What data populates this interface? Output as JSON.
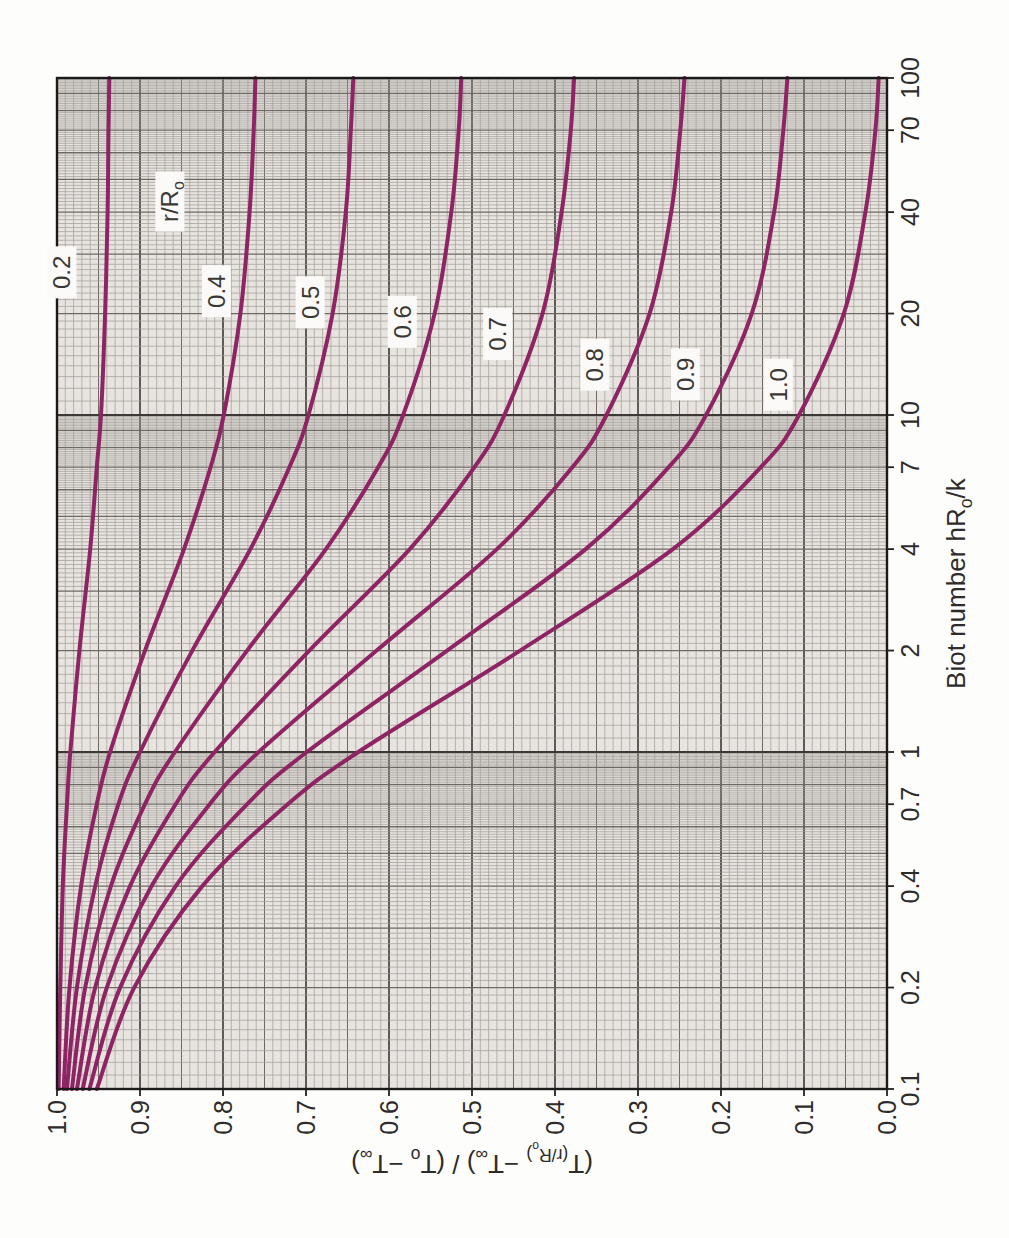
{
  "figure": {
    "description_label": "rotated scanned chart page",
    "style": {
      "curve_color": "#8e2463",
      "paper_color": "#e7e3df",
      "label_box_color": "#fbfaf8",
      "grid_minor_color": "#a19c96",
      "grid_medium_color": "#6e6962",
      "grid_major_color": "#3b3835",
      "border_color": "#1a1a1a",
      "text_color": "#2e2c2a"
    }
  },
  "chart_data": {
    "type": "line",
    "title": "",
    "xlabel": "Biot number hR_{o}/k",
    "ylabel": "(T_{(r/R_{o})} −T_{∞}) / (T_{o} −T_{∞})",
    "x_scale": "log",
    "xlim": [
      0.1,
      100
    ],
    "ylim": [
      0.0,
      1.0
    ],
    "grid": "on",
    "x_tick_labels": [
      "0.1",
      "0.2",
      "0.4",
      "0.7",
      "1",
      "2",
      "4",
      "7",
      "10",
      "20",
      "40",
      "70",
      "100"
    ],
    "x_tick_values": [
      0.1,
      0.2,
      0.4,
      0.7,
      1,
      2,
      4,
      7,
      10,
      20,
      40,
      70,
      100
    ],
    "y_tick_labels": [
      "1.0",
      "0.9",
      "0.8",
      "0.7",
      "0.6",
      "0.5",
      "0.4",
      "0.3",
      "0.2",
      "0.1",
      "0.0"
    ],
    "y_tick_values": [
      1.0,
      0.9,
      0.8,
      0.7,
      0.6,
      0.5,
      0.4,
      0.3,
      0.2,
      0.1,
      0.0
    ],
    "family_label": {
      "text": "r/R_{o}",
      "bi": 43,
      "ratio": 0.864
    },
    "x": [
      0.1,
      0.2,
      0.4,
      0.7,
      1,
      2,
      4,
      7,
      10,
      20,
      40,
      70,
      100
    ],
    "series": [
      {
        "name": "0.2",
        "r_over_Ro": 0.2,
        "label_at": {
          "bi": 26.5,
          "ratio": 0.994
        },
        "values": [
          0.998,
          0.996,
          0.993,
          0.988,
          0.984,
          0.973,
          0.96,
          0.952,
          0.947,
          0.942,
          0.939,
          0.938,
          0.937
        ]
      },
      {
        "name": "0.4",
        "r_over_Ro": 0.4,
        "label_at": {
          "bi": 23.3,
          "ratio": 0.808
        },
        "values": [
          0.992,
          0.985,
          0.971,
          0.952,
          0.936,
          0.894,
          0.847,
          0.815,
          0.799,
          0.779,
          0.768,
          0.763,
          0.761
        ]
      },
      {
        "name": "0.5",
        "r_over_Ro": 0.5,
        "label_at": {
          "bi": 21.6,
          "ratio": 0.695
        },
        "values": [
          0.988,
          0.976,
          0.954,
          0.926,
          0.9,
          0.837,
          0.767,
          0.72,
          0.697,
          0.668,
          0.652,
          0.646,
          0.643
        ]
      },
      {
        "name": "0.6",
        "r_over_Ro": 0.6,
        "label_at": {
          "bi": 18.9,
          "ratio": 0.584
        },
        "values": [
          0.982,
          0.966,
          0.935,
          0.894,
          0.858,
          0.771,
          0.676,
          0.613,
          0.583,
          0.545,
          0.525,
          0.516,
          0.513
        ]
      },
      {
        "name": "0.7",
        "r_over_Ro": 0.7,
        "label_at": {
          "bi": 17.4,
          "ratio": 0.469
        },
        "values": [
          0.976,
          0.954,
          0.912,
          0.857,
          0.81,
          0.696,
          0.575,
          0.497,
          0.461,
          0.415,
          0.392,
          0.381,
          0.377
        ]
      },
      {
        "name": "0.8",
        "r_over_Ro": 0.8,
        "label_at": {
          "bi": 14.1,
          "ratio": 0.352
        },
        "values": [
          0.969,
          0.94,
          0.886,
          0.816,
          0.757,
          0.615,
          0.47,
          0.379,
          0.338,
          0.286,
          0.26,
          0.249,
          0.244
        ]
      },
      {
        "name": "0.9",
        "r_over_Ro": 0.9,
        "label_at": {
          "bi": 13.2,
          "ratio": 0.243
        },
        "values": [
          0.961,
          0.924,
          0.857,
          0.771,
          0.699,
          0.53,
          0.363,
          0.263,
          0.218,
          0.163,
          0.136,
          0.125,
          0.12
        ]
      },
      {
        "name": "1.0",
        "r_over_Ro": 1.0,
        "label_at": {
          "bi": 12.3,
          "ratio": 0.131
        },
        "values": [
          0.952,
          0.907,
          0.825,
          0.722,
          0.637,
          0.442,
          0.258,
          0.152,
          0.106,
          0.052,
          0.026,
          0.014,
          0.01
        ]
      }
    ]
  }
}
